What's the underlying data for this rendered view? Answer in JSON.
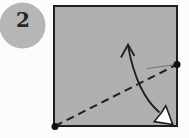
{
  "step_badge": {
    "number": "2"
  },
  "colors": {
    "background": "#fcfcfc",
    "paper_fill": "#b0b0b0",
    "paper_stroke": "#1f1f1f",
    "badge_fill": "#b6b6b6",
    "number_color": "#262626",
    "line": "#1f1f1f",
    "dot": "#101010",
    "arrowhead_fill": "#ffffff",
    "reference_line": "#707070"
  }
}
